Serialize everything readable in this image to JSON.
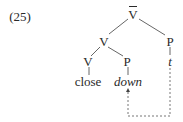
{
  "example": {
    "number": "(25)"
  },
  "tree": {
    "root": {
      "label": "V",
      "bar": true
    },
    "v_phrase": {
      "label": "V"
    },
    "p_right": {
      "label": "P"
    },
    "v_head": {
      "label": "V"
    },
    "p_mid": {
      "label": "P"
    },
    "leaf_close": {
      "label": "close"
    },
    "leaf_down": {
      "label": "down"
    },
    "trace": {
      "label": "t"
    }
  },
  "movement_arrow": {
    "from": "t",
    "to": "down",
    "style": "dashed"
  },
  "colors": {
    "ink": "#2a2a2a",
    "background": "#ffffff"
  }
}
